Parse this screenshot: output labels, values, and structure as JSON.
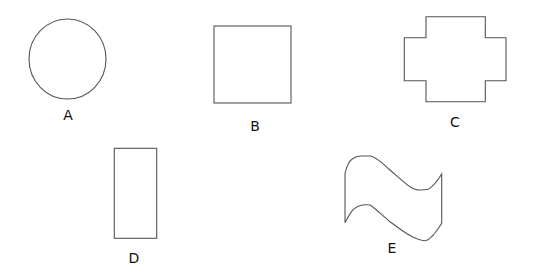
{
  "figure": {
    "shapes": [
      {
        "id": "A",
        "label": "A",
        "type": "circle"
      },
      {
        "id": "B",
        "label": "B",
        "type": "square"
      },
      {
        "id": "C",
        "label": "C",
        "type": "cross-like polygon"
      },
      {
        "id": "D",
        "label": "D",
        "type": "rectangle"
      },
      {
        "id": "E",
        "label": "E",
        "type": "curved wave shape"
      }
    ],
    "stroke_color": "#555555",
    "background": "#ffffff"
  }
}
